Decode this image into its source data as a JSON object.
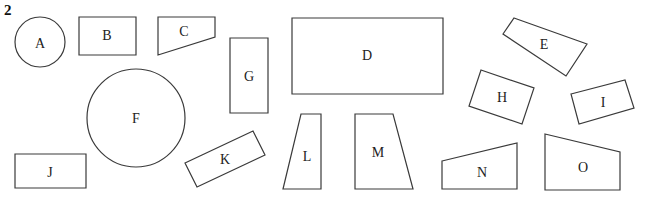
{
  "figure": {
    "number": "2",
    "stroke_color": "#3a3a3a",
    "background": "#ffffff"
  },
  "shapes": [
    {
      "label": "A",
      "kind": "circle",
      "cx": 40,
      "cy": 42,
      "r": 25
    },
    {
      "label": "B",
      "kind": "rectangle",
      "points": [
        [
          79,
          17
        ],
        [
          136,
          17
        ],
        [
          136,
          55
        ],
        [
          79,
          55
        ]
      ]
    },
    {
      "label": "C",
      "kind": "trapezoid",
      "points": [
        [
          158,
          17
        ],
        [
          215,
          17
        ],
        [
          215,
          37
        ],
        [
          158,
          55
        ]
      ]
    },
    {
      "label": "D",
      "kind": "rectangle",
      "points": [
        [
          292,
          18
        ],
        [
          443,
          18
        ],
        [
          443,
          94
        ],
        [
          292,
          94
        ]
      ]
    },
    {
      "label": "E",
      "kind": "quadrilateral",
      "points": [
        [
          514,
          18
        ],
        [
          587,
          44
        ],
        [
          566,
          76
        ],
        [
          503,
          34
        ]
      ]
    },
    {
      "label": "F",
      "kind": "circle",
      "cx": 136,
      "cy": 118,
      "r": 49
    },
    {
      "label": "G",
      "kind": "rectangle",
      "points": [
        [
          230,
          38
        ],
        [
          268,
          38
        ],
        [
          268,
          113
        ],
        [
          230,
          113
        ]
      ]
    },
    {
      "label": "H",
      "kind": "rectangle",
      "points": [
        [
          481,
          70
        ],
        [
          534,
          88
        ],
        [
          522,
          124
        ],
        [
          469,
          106
        ]
      ]
    },
    {
      "label": "I",
      "kind": "rectangle",
      "points": [
        [
          571,
          94
        ],
        [
          625,
          80
        ],
        [
          634,
          108
        ],
        [
          579,
          124
        ]
      ]
    },
    {
      "label": "J",
      "kind": "rectangle",
      "points": [
        [
          15,
          154
        ],
        [
          86,
          154
        ],
        [
          86,
          188
        ],
        [
          15,
          188
        ]
      ]
    },
    {
      "label": "K",
      "kind": "rectangle",
      "points": [
        [
          185,
          163
        ],
        [
          253,
          131
        ],
        [
          265,
          155
        ],
        [
          197,
          187
        ]
      ]
    },
    {
      "label": "L",
      "kind": "trapezoid",
      "points": [
        [
          301,
          114
        ],
        [
          321,
          114
        ],
        [
          321,
          189
        ],
        [
          283,
          189
        ]
      ]
    },
    {
      "label": "M",
      "kind": "trapezoid",
      "points": [
        [
          355,
          114
        ],
        [
          393,
          114
        ],
        [
          413,
          189
        ],
        [
          355,
          189
        ]
      ]
    },
    {
      "label": "N",
      "kind": "trapezoid",
      "points": [
        [
          442,
          161
        ],
        [
          517,
          143
        ],
        [
          517,
          189
        ],
        [
          442,
          189
        ]
      ]
    },
    {
      "label": "O",
      "kind": "trapezoid",
      "points": [
        [
          545,
          134
        ],
        [
          620,
          152
        ],
        [
          620,
          190
        ],
        [
          545,
          190
        ]
      ]
    }
  ],
  "label_positions": {
    "A": [
      40,
      43
    ],
    "B": [
      107,
      35
    ],
    "C": [
      184,
      31
    ],
    "D": [
      367,
      55
    ],
    "E": [
      544,
      44
    ],
    "F": [
      136,
      118
    ],
    "G": [
      249,
      76
    ],
    "H": [
      502,
      97
    ],
    "I": [
      603,
      102
    ],
    "J": [
      50,
      172
    ],
    "K": [
      225,
      159
    ],
    "L": [
      307,
      156
    ],
    "M": [
      378,
      152
    ],
    "N": [
      482,
      172
    ],
    "O": [
      583,
      167
    ]
  }
}
